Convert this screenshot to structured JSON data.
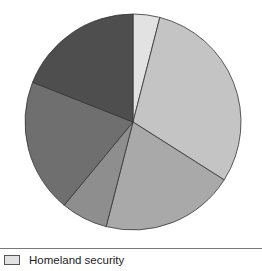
{
  "chart_data": {
    "type": "pie",
    "title": "",
    "start_angle_deg": 0,
    "direction": "clockwise",
    "slices": [
      {
        "label": "Homeland security",
        "value": 4,
        "color": "#e2e2e2"
      },
      {
        "label": "",
        "value": 30,
        "color": "#c4c4c4"
      },
      {
        "label": "",
        "value": 20,
        "color": "#a9a9a9"
      },
      {
        "label": "",
        "value": 7,
        "color": "#8e8e8e"
      },
      {
        "label": "",
        "value": 20,
        "color": "#6f6f6f"
      },
      {
        "label": "",
        "value": 19,
        "color": "#4e4e4e"
      }
    ],
    "legend": {
      "position": "bottom",
      "entries": [
        "Homeland security"
      ]
    }
  },
  "legend": {
    "label": "Homeland security",
    "swatch_color": "#e2e2e2"
  }
}
